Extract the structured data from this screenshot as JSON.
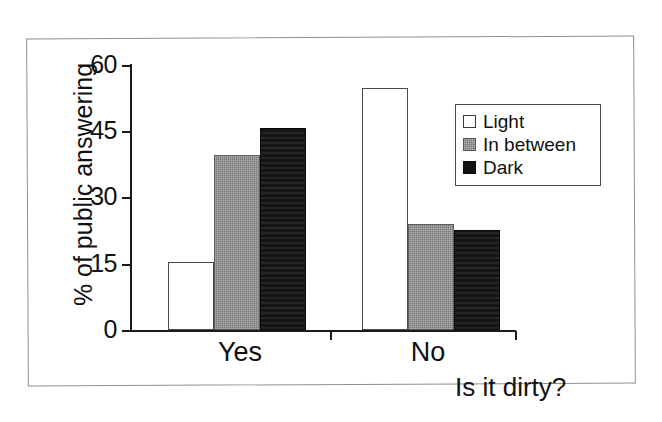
{
  "chart_data": {
    "type": "bar",
    "title": "",
    "xlabel": "Is it dirty?",
    "ylabel": "% of public answering",
    "categories": [
      "Yes",
      "No"
    ],
    "series": [
      {
        "name": "Light",
        "values": [
          15.3,
          54.5
        ],
        "color": "#ffffff"
      },
      {
        "name": "In between",
        "values": [
          39.5,
          24.0
        ],
        "color": "#7a7a7a"
      },
      {
        "name": "Dark",
        "values": [
          45.5,
          22.5
        ],
        "color": "#151515"
      }
    ],
    "ylim": [
      0,
      60
    ],
    "yticks": [
      0,
      15,
      30,
      45,
      60
    ],
    "ytick_labels": [
      "0",
      "15",
      "30",
      "45",
      "60"
    ],
    "grid": false,
    "legend_position": "upper right",
    "legend_entries": [
      "Light",
      "In between",
      "Dark"
    ]
  },
  "axis": {
    "y_title": "% of public answering",
    "x_title": "Is it dirty?",
    "ticks": [
      {
        "label": "60",
        "value": 60
      },
      {
        "label": "45",
        "value": 45
      },
      {
        "label": "30",
        "value": 30
      },
      {
        "label": "15",
        "value": 15
      },
      {
        "label": "0",
        "value": 0
      }
    ],
    "categories": [
      {
        "label": "Yes"
      },
      {
        "label": "No"
      }
    ]
  },
  "legend": {
    "items": [
      {
        "label": "Light",
        "swatch": "light-swatch-icon"
      },
      {
        "label": "In between",
        "swatch": "mid-gray-swatch-icon"
      },
      {
        "label": "Dark",
        "swatch": "dark-swatch-icon"
      }
    ]
  }
}
